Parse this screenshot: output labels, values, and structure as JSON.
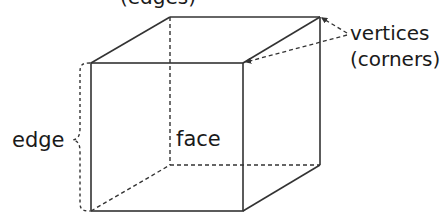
{
  "diagram": {
    "type": "cube-anatomy",
    "colors": {
      "line": "#333333",
      "text": "#1a1a1a",
      "background": "#ffffff"
    },
    "labels": {
      "top_clipped": "(edges)",
      "edge": "edge",
      "face": "face",
      "vertices": "vertices",
      "corners": "(corners)"
    },
    "cube": {
      "front_face": {
        "tl": [
          91,
          63
        ],
        "tr": [
          243,
          63
        ],
        "br": [
          243,
          211
        ],
        "bl": [
          91,
          211
        ]
      },
      "back_face": {
        "tl": [
          170,
          17
        ],
        "tr": [
          320,
          17
        ],
        "br": [
          320,
          165
        ],
        "bl": [
          170,
          165
        ]
      },
      "hidden_edges": [
        "back-left-vertical",
        "back-bottom",
        "bottom-left-depth"
      ]
    },
    "annotations": {
      "edge_brace": {
        "x": 80,
        "y_top": 63,
        "y_bottom": 211
      },
      "vertex_pointers": [
        [
          320,
          17
        ],
        [
          245,
          63
        ]
      ]
    }
  }
}
